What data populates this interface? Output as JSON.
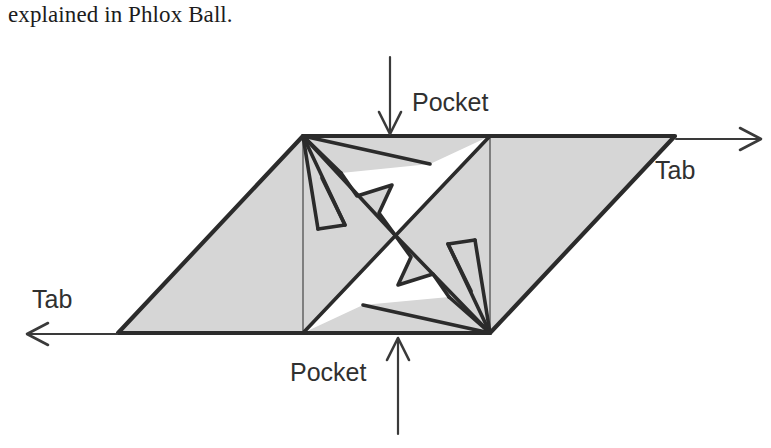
{
  "caption": {
    "text": "explained in Phlox Ball."
  },
  "figure": {
    "name": "phlox-ball-crease-pattern",
    "colors": {
      "paper_fill": "#d6d6d6",
      "white_fill": "#ffffff",
      "stroke": "#2b2b2b",
      "thin_stroke": "#5a5a5a",
      "text": "#303030",
      "caption_text": "#1c1c1c",
      "background": "#ffffff"
    },
    "labels": {
      "pocket_top": "Pocket",
      "pocket_bottom": "Pocket",
      "tab_right": "Tab",
      "tab_left": "Tab"
    },
    "arrows": [
      {
        "name": "arrow-pocket-top",
        "direction": "down"
      },
      {
        "name": "arrow-pocket-bottom",
        "direction": "up"
      },
      {
        "name": "arrow-tab-right",
        "direction": "right"
      },
      {
        "name": "arrow-tab-left",
        "direction": "left"
      }
    ],
    "geometry": {
      "outline_parallelogram": "118,333 303,136 675,136 490,333",
      "inner_square": "303,136 490,136 490,333 303,333",
      "center_point": "395,235",
      "top_left_corner": "303,136",
      "bottom_right_corner": "490,333",
      "left_vertex": "118,333",
      "right_vertex": "675,136"
    }
  }
}
